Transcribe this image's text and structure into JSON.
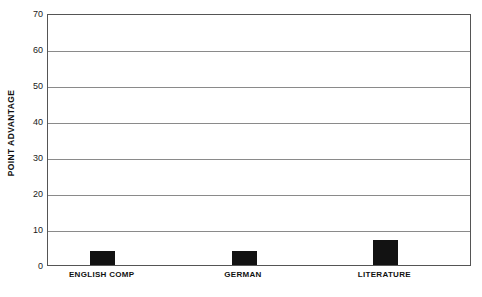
{
  "chart_data": {
    "type": "bar",
    "title": "",
    "subtitle": "",
    "xlabel": "",
    "ylabel": "POINT ADVANTAGE",
    "categories": [
      "ENGLISH COMP",
      "GERMAN",
      "LITERATURE"
    ],
    "values": [
      4,
      4,
      7
    ],
    "series": [
      {
        "name": "Point advantage",
        "values": [
          4,
          4,
          7
        ],
        "color": "#121212"
      }
    ],
    "ylim": [
      0,
      70
    ],
    "yticks": [
      0,
      10,
      20,
      30,
      40,
      50,
      60,
      70
    ],
    "ytick_labels": [
      "0",
      "10",
      "20",
      "30",
      "40",
      "50",
      "60",
      "70"
    ],
    "grid": true,
    "grid_axis": "y",
    "grid_color": "#8a8a8a",
    "legend": false,
    "legend_position": "none",
    "frame_color": "#555555",
    "background": "#ffffff"
  }
}
